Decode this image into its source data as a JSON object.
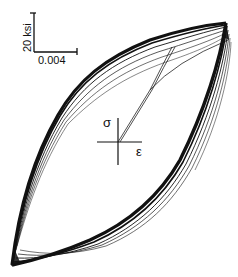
{
  "figure": {
    "type": "stress-strain hysteresis loops",
    "scale_bar": {
      "vertical_label": "20 ksi",
      "horizontal_label": "0.004"
    },
    "axes": {
      "y_symbol": "σ",
      "x_symbol": "ε"
    },
    "colors": {
      "ink": "#111111",
      "background": "#ffffff"
    }
  }
}
